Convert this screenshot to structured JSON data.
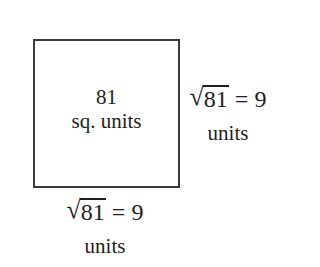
{
  "diagram": {
    "shape": "square",
    "area": {
      "value": "81",
      "unit": "sq. units"
    },
    "right_side": {
      "radical_symbol": "√",
      "radicand": "81",
      "result": " = 9",
      "unit": "units"
    },
    "bottom_side": {
      "radical_symbol": "√",
      "radicand": "81",
      "result": " = 9",
      "unit": "units"
    },
    "colors": {
      "stroke": "#3a3a3a",
      "text": "#1e1e1e",
      "background": "#ffffff"
    }
  }
}
